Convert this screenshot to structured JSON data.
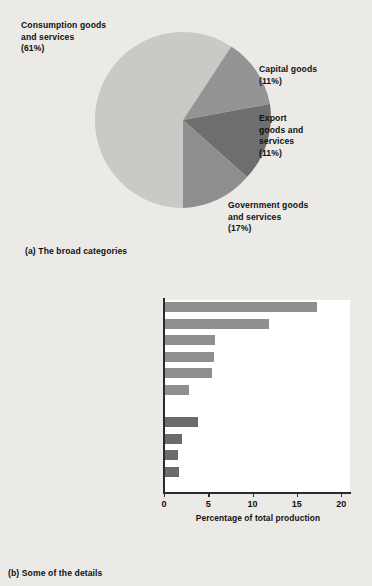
{
  "figure": {
    "panel_a": {
      "caption": "(a) The broad categories",
      "labels": [
        {
          "name": "consumption",
          "text": "Consumption goods\nand services\n(61%)"
        },
        {
          "name": "capital",
          "text": "Capital goods\n(11%)"
        },
        {
          "name": "export",
          "text": "Export\ngoods and\nservices\n(11%)"
        },
        {
          "name": "government",
          "text": "Government goods\nand services\n(17%)"
        }
      ]
    },
    "panel_b": {
      "caption": "(b) Some of the details"
    }
  },
  "chart_data": [
    {
      "type": "pie",
      "title": "The broad categories",
      "labels": [
        "Consumption goods and services",
        "Capital goods",
        "Export goods and services",
        "Government goods and services"
      ],
      "values": [
        61,
        11,
        11,
        17
      ],
      "unit": "%",
      "colors": [
        "#c9c9c5",
        "#949494",
        "#6e6e6e",
        "#8e8e8e"
      ],
      "start_angle_deg": -90,
      "direction": "clockwise",
      "legend": "outside-labels"
    },
    {
      "type": "bar",
      "orientation": "horizontal",
      "title": "Some of the details",
      "xlabel": "Percentage of total production",
      "ylabel": "",
      "xlim": [
        0,
        21
      ],
      "xticks": [
        0,
        5,
        10,
        15,
        20
      ],
      "xtick_labels": [
        "0",
        "5",
        "10",
        "15",
        "20"
      ],
      "grid": false,
      "groups": [
        {
          "name": "Services",
          "categories": [
            "Health",
            "Real estate",
            "Education",
            "Retail trades",
            "Wholesale trades",
            "Transportation and storage"
          ],
          "values": [
            17.3,
            11.8,
            5.8,
            5.7,
            5.4,
            2.8
          ],
          "color": "#8f8f8f"
        },
        {
          "name": "Goods",
          "categories": [
            "Construction",
            "Utilities",
            "Food",
            "Chemicals"
          ],
          "values": [
            3.8,
            2.0,
            1.6,
            1.7
          ],
          "color": "#6b6b6b"
        }
      ]
    }
  ]
}
